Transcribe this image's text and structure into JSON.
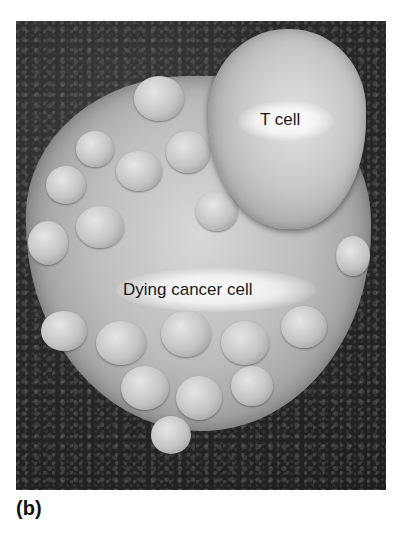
{
  "figure": {
    "panel_label": "(b)",
    "labels": {
      "t_cell": "T cell",
      "cancer_cell": "Dying cancer cell"
    }
  }
}
